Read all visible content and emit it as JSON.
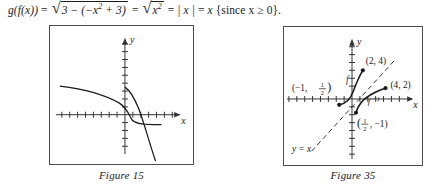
{
  "equation": {
    "full_text": "g(f(x)) = √(3 − (−x² + 3)) = √(x²) = |x| = x {since x ≥ 0}.",
    "lhs": "g(f(x))",
    "eq1": "=",
    "radicand1": "3 − (−x",
    "radicand1_exp": "2",
    "radicand1_tail": " + 3)",
    "eq2": "=",
    "radicand2": "x",
    "radicand2_exp": "2",
    "eq3": "=",
    "abs_x": "| x |",
    "eq4": "=",
    "rhs_x": "x",
    "condition": "{since x ≥ 0}."
  },
  "figures": [
    {
      "id": "figure-15",
      "caption": "Figure 15",
      "axis_labels": {
        "x": "x",
        "y": "y"
      },
      "description": "Two decreasing curves crossing near the origin on a tick-marked coordinate grid",
      "curves": [
        {
          "name": "shallow-decreasing-curve",
          "points": "12,62 28,64 44,67 58,71 68,76 75,82 79,88 81,93 83,97 88,99 94,100 104,100 112,99"
        },
        {
          "name": "steep-decreasing-curve",
          "points": "77,63 82,67 86,73 89,80 92,89 95,100 99,113 103,126 107,136"
        }
      ],
      "grid": {
        "x_axis_y": 90,
        "y_axis_x": 76,
        "tick_spacing": 8,
        "tick_half_length": 3
      }
    },
    {
      "id": "figure-35",
      "caption": "Figure 35",
      "axis_labels": {
        "x": "x",
        "y": "y"
      },
      "description": "A function f and its inverse f-inverse reflected about the dashed line y = x",
      "curve_labels": [
        {
          "name": "f-label",
          "text": "f"
        },
        {
          "name": "f-inverse-label",
          "text": "f −1"
        }
      ],
      "point_labels": [
        {
          "name": "point-2-4",
          "text": "(2, 4)"
        },
        {
          "name": "point-4-2",
          "text": "(4, 2)"
        },
        {
          "name": "point-neg1-half",
          "text": "(−1, ½)",
          "num": "1",
          "den": "2",
          "prefix": "(−1, ",
          "suffix": ")"
        },
        {
          "name": "point-half-neg1",
          "text": "(½, −1)",
          "num": "1",
          "den": "2",
          "prefix": "(",
          "suffix": ", −1)"
        }
      ],
      "line_label": {
        "name": "y-equals-x-label",
        "text": "y = x"
      },
      "grid": {
        "x_axis_y": 73,
        "y_axis_x": 69,
        "tick_spacing": 8,
        "tick_half_length": 3
      }
    }
  ]
}
